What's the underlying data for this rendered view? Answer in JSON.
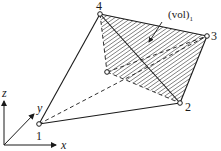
{
  "figure": {
    "volume_label": "(vol)",
    "volume_subscript": "1",
    "nodes": [
      {
        "id": "1",
        "x": 39,
        "y": 124
      },
      {
        "id": "2",
        "x": 180,
        "y": 103
      },
      {
        "id": "3",
        "x": 207,
        "y": 36
      },
      {
        "id": "4",
        "x": 100,
        "y": 14
      },
      {
        "id": "",
        "x": 107,
        "y": 72
      }
    ],
    "axes": {
      "x": "x",
      "y": "y",
      "z": "z"
    },
    "colors": {
      "line": "#1a1a1a",
      "background": "#ffffff"
    }
  }
}
